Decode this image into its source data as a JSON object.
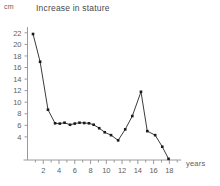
{
  "chart_data": {
    "type": "line",
    "title": "Increase in stature",
    "xlabel": "years",
    "ylabel": "cm",
    "y_unit_label": "cm",
    "x_unit_label": "years",
    "xlim": [
      0,
      19.5
    ],
    "ylim": [
      0,
      23
    ],
    "grid": false,
    "legend": null,
    "x_ticks": [
      2,
      4,
      6,
      8,
      10,
      12,
      14,
      16,
      18
    ],
    "y_ticks": [
      4,
      6,
      8,
      10,
      12,
      14,
      16,
      18,
      20,
      22
    ],
    "x_tick_labels": [
      "2",
      "4",
      "6",
      "8",
      "10",
      "12",
      "14",
      "16",
      "18"
    ],
    "y_tick_labels": [
      "4",
      "6",
      "8",
      "10",
      "12",
      "14",
      "16",
      "18",
      "20",
      "22"
    ],
    "marker": "square",
    "line_color": "#3c3c3c",
    "marker_color": "#1a1a1a",
    "axis_color": "#9a9a9a",
    "background_color": "#ffffff",
    "series": [
      {
        "name": "Increase in stature",
        "x": [
          0.7,
          1.6,
          2.6,
          3.5,
          4.1,
          4.7,
          5.4,
          6.0,
          6.6,
          7.2,
          7.8,
          8.4,
          9.1,
          9.8,
          10.6,
          11.5,
          12.4,
          13.3,
          14.4,
          15.2,
          16.2,
          17.1,
          17.9
        ],
        "y": [
          21.8,
          17.0,
          8.7,
          6.35,
          6.3,
          6.45,
          6.1,
          6.3,
          6.45,
          6.4,
          6.35,
          6.1,
          5.5,
          4.8,
          4.3,
          3.4,
          5.3,
          7.6,
          11.8,
          5.0,
          4.3,
          2.3,
          0.2
        ]
      }
    ]
  }
}
